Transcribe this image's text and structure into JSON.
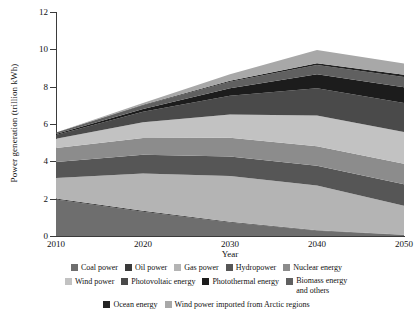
{
  "chart_data": {
    "type": "area",
    "stacked": true,
    "title": "",
    "xlabel": "Year",
    "ylabel": "Power generation (trillion kWh)",
    "x": [
      2010,
      2020,
      2030,
      2040,
      2050
    ],
    "xtick_labels": [
      "2010",
      "2020",
      "2030",
      "2040",
      "2050"
    ],
    "ytick_labels": [
      "0",
      "2",
      "4",
      "6",
      "8",
      "10",
      "12"
    ],
    "xlim": [
      2010,
      2050
    ],
    "ylim": [
      0,
      12
    ],
    "grid": false,
    "legend_position": "bottom",
    "series": [
      {
        "name": "Coal power",
        "color": "#6e6e6e",
        "values": [
          1.95,
          1.3,
          0.72,
          0.28,
          0.05
        ]
      },
      {
        "name": "Oil power",
        "color": "#3a3a3a",
        "values": [
          0.06,
          0.05,
          0.04,
          0.03,
          0.02
        ]
      },
      {
        "name": "Gas power",
        "color": "#b4b4b4",
        "values": [
          1.1,
          2.0,
          2.45,
          2.4,
          1.55
        ]
      },
      {
        "name": "Hydropower",
        "color": "#565656",
        "values": [
          0.85,
          1.0,
          1.05,
          1.05,
          1.15
        ]
      },
      {
        "name": "Nuclear energy",
        "color": "#8c8c8c",
        "values": [
          0.75,
          0.9,
          1.0,
          1.05,
          1.1
        ]
      },
      {
        "name": "Wind power",
        "color": "#c2c2c2",
        "values": [
          0.5,
          0.85,
          1.25,
          1.65,
          1.7
        ]
      },
      {
        "name": "Photovoltaic energy",
        "color": "#4a4a4a",
        "values": [
          0.2,
          0.55,
          1.0,
          1.45,
          1.55
        ]
      },
      {
        "name": "Photothermal energy",
        "color": "#1c1c1c",
        "values": [
          0.05,
          0.15,
          0.4,
          0.75,
          0.85
        ]
      },
      {
        "name": "Biomass energy and others",
        "color": "#606060",
        "values": [
          0.08,
          0.2,
          0.35,
          0.5,
          0.55
        ]
      },
      {
        "name": "Ocean energy",
        "color": "#232323",
        "values": [
          0.01,
          0.03,
          0.06,
          0.1,
          0.12
        ]
      },
      {
        "name": "Wind power imported from Arctic regions",
        "color": "#a8a8a8",
        "values": [
          0.0,
          0.1,
          0.35,
          0.7,
          0.6
        ]
      }
    ],
    "totals": [
      5.55,
      7.13,
      8.67,
      9.96,
      9.24
    ]
  },
  "axes": {
    "y_label": "Power generation (trillion kWh)",
    "x_label": "Year",
    "y_ticks": [
      "12",
      "10",
      "8",
      "6",
      "4",
      "2",
      "0"
    ],
    "x_ticks": [
      "2010",
      "2020",
      "2030",
      "2040",
      "2050"
    ]
  },
  "legend": {
    "rows": [
      [
        {
          "label": "Coal power",
          "color": "#6e6e6e",
          "icon": "legend-swatch-icon"
        },
        {
          "label": "Oil power",
          "color": "#3a3a3a",
          "icon": "legend-swatch-icon"
        },
        {
          "label": "Gas power",
          "color": "#b4b4b4",
          "icon": "legend-swatch-icon"
        },
        {
          "label": "Hydropower",
          "color": "#565656",
          "icon": "legend-swatch-icon"
        },
        {
          "label": "Nuclear energy",
          "color": "#8c8c8c",
          "icon": "legend-swatch-icon"
        }
      ],
      [
        {
          "label": "Wind power",
          "color": "#c2c2c2",
          "icon": "legend-swatch-icon"
        },
        {
          "label": "Photovoltaic energy",
          "color": "#4a4a4a",
          "icon": "legend-swatch-icon"
        },
        {
          "label": "Photothermal energy",
          "color": "#1c1c1c",
          "icon": "legend-swatch-icon"
        },
        {
          "label": "Biomass energy and others",
          "color": "#606060",
          "icon": "legend-swatch-icon"
        }
      ],
      [
        {
          "label": "Ocean energy",
          "color": "#232323",
          "icon": "legend-swatch-icon"
        },
        {
          "label": "Wind power imported from Arctic regions",
          "color": "#a8a8a8",
          "icon": "legend-swatch-icon"
        }
      ]
    ]
  }
}
